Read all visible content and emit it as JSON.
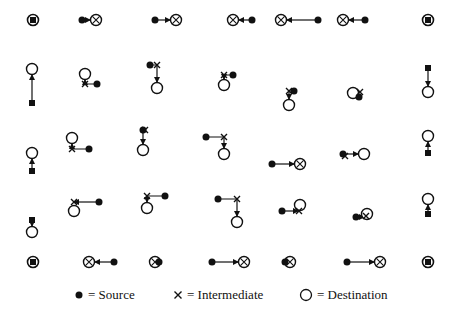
{
  "legend": {
    "source_label": "= Source",
    "intermediate_label": "= Intermediate",
    "destination_label": "= Destination"
  },
  "colors": {
    "ink": "#111111",
    "background": "#ffffff"
  },
  "diagram": {
    "corner_nodes": [
      {
        "x": 33,
        "y": 20
      },
      {
        "x": 428,
        "y": 20
      },
      {
        "x": 33,
        "y": 262
      },
      {
        "x": 428,
        "y": 262
      }
    ],
    "paths": [
      {
        "name": "top-1",
        "pts": [
          [
            82,
            20
          ],
          [
            96,
            20
          ]
        ],
        "dest": "xcircle"
      },
      {
        "name": "top-2",
        "pts": [
          [
            155,
            20
          ],
          [
            176,
            20
          ]
        ],
        "dest": "xcircle"
      },
      {
        "name": "top-3",
        "pts": [
          [
            252,
            20
          ],
          [
            233,
            20
          ]
        ],
        "dest": "xcircle"
      },
      {
        "name": "top-4",
        "pts": [
          [
            318,
            20
          ],
          [
            281,
            20
          ]
        ],
        "dest": "xcircle"
      },
      {
        "name": "top-5",
        "pts": [
          [
            365,
            20
          ],
          [
            343,
            20
          ]
        ],
        "dest": "xcircle"
      },
      {
        "name": "left-1",
        "pts": [
          [
            32,
            103
          ],
          [
            32,
            69
          ]
        ],
        "dest": "circle",
        "src": "square"
      },
      {
        "name": "left-2",
        "pts": [
          [
            32,
            171
          ],
          [
            32,
            153
          ]
        ],
        "dest": "circle",
        "src": "square"
      },
      {
        "name": "left-3",
        "pts": [
          [
            32,
            220
          ],
          [
            32,
            232
          ]
        ],
        "dest": "circle",
        "src": "square"
      },
      {
        "name": "right-1",
        "pts": [
          [
            428,
            68
          ],
          [
            428,
            92
          ]
        ],
        "dest": "circle",
        "src": "square"
      },
      {
        "name": "right-2",
        "pts": [
          [
            428,
            153
          ],
          [
            428,
            136
          ]
        ],
        "dest": "circle",
        "src": "square"
      },
      {
        "name": "right-3",
        "pts": [
          [
            428,
            214
          ],
          [
            428,
            199
          ]
        ],
        "dest": "circle",
        "src": "square"
      },
      {
        "name": "bottom-1",
        "pts": [
          [
            114,
            262
          ],
          [
            89,
            262
          ]
        ],
        "dest": "xcircle"
      },
      {
        "name": "bottom-2",
        "pts": [
          [
            159,
            262
          ],
          [
            155,
            262
          ]
        ],
        "dest": "xcircle"
      },
      {
        "name": "bottom-3",
        "pts": [
          [
            212,
            262
          ],
          [
            244,
            262
          ]
        ],
        "dest": "xcircle"
      },
      {
        "name": "bottom-4",
        "pts": [
          [
            285,
            262
          ],
          [
            290,
            262
          ]
        ],
        "dest": "xcircle"
      },
      {
        "name": "bottom-5",
        "pts": [
          [
            347,
            262
          ],
          [
            380,
            262
          ]
        ],
        "dest": "xcircle"
      },
      {
        "name": "r1-a",
        "pts": [
          [
            97,
            84
          ],
          [
            85,
            84
          ],
          [
            85,
            74
          ]
        ],
        "dest": "circle",
        "mid": [
          85,
          84
        ]
      },
      {
        "name": "r1-b",
        "pts": [
          [
            150,
            65
          ],
          [
            157,
            65
          ],
          [
            157,
            88
          ]
        ],
        "dest": "circle",
        "mid": [
          157,
          65
        ]
      },
      {
        "name": "r1-c",
        "pts": [
          [
            233,
            75
          ],
          [
            224,
            75
          ],
          [
            224,
            85
          ]
        ],
        "dest": "circle",
        "mid": [
          224,
          75
        ]
      },
      {
        "name": "r1-d",
        "pts": [
          [
            294,
            91
          ],
          [
            289,
            91
          ],
          [
            289,
            105
          ]
        ],
        "dest": "circle",
        "mid": [
          289,
          91
        ]
      },
      {
        "name": "r1-e",
        "pts": [
          [
            359,
            97
          ],
          [
            353,
            91
          ]
        ],
        "dest": "circle",
        "destpos": [
          353,
          93
        ],
        "mid": [
          360,
          92
        ]
      },
      {
        "name": "r2-a",
        "pts": [
          [
            89,
            149
          ],
          [
            72,
            149
          ],
          [
            72,
            138
          ]
        ],
        "dest": "circle",
        "mid": [
          72,
          149
        ]
      },
      {
        "name": "r2-b",
        "pts": [
          [
            143,
            130
          ],
          [
            143,
            150
          ]
        ],
        "dest": "circle",
        "mid": [
          145,
          130
        ]
      },
      {
        "name": "r2-c",
        "pts": [
          [
            206,
            137
          ],
          [
            224,
            137
          ],
          [
            224,
            154
          ]
        ],
        "dest": "circle",
        "mid": [
          224,
          137
        ]
      },
      {
        "name": "r2-d",
        "pts": [
          [
            272,
            164
          ],
          [
            300,
            164
          ]
        ],
        "dest": "xcircle"
      },
      {
        "name": "r2-e",
        "pts": [
          [
            343,
            154
          ],
          [
            364,
            154
          ]
        ],
        "dest": "circle",
        "mid": [
          345,
          156
        ]
      },
      {
        "name": "r3-a",
        "pts": [
          [
            99,
            202
          ],
          [
            74,
            202
          ]
        ],
        "dest": "circle",
        "destpos": [
          74,
          211
        ],
        "mid": [
          74,
          202
        ]
      },
      {
        "name": "r3-b",
        "pts": [
          [
            165,
            196
          ],
          [
            147,
            196
          ],
          [
            147,
            208
          ]
        ],
        "dest": "circle",
        "mid": [
          147,
          196
        ]
      },
      {
        "name": "r3-c",
        "pts": [
          [
            218,
            199
          ],
          [
            237,
            199
          ],
          [
            237,
            222
          ]
        ],
        "dest": "circle",
        "mid": [
          237,
          199
        ]
      },
      {
        "name": "r3-d",
        "pts": [
          [
            282,
            211
          ],
          [
            298,
            211
          ]
        ],
        "dest": "circle",
        "destpos": [
          300,
          205
        ],
        "mid": [
          299,
          211
        ]
      },
      {
        "name": "r3-e",
        "pts": [
          [
            356,
            217
          ],
          [
            364,
            217
          ]
        ],
        "dest": "circle",
        "destpos": [
          367,
          214
        ],
        "mid": [
          366,
          216
        ]
      }
    ]
  }
}
